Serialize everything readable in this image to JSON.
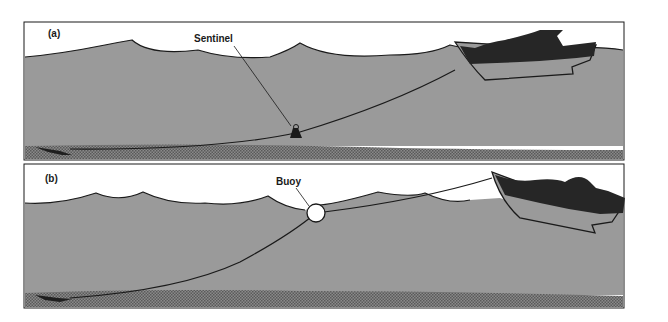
{
  "figure": {
    "panels": [
      {
        "id": "a",
        "panel_label": "(a)",
        "callout_label": "Sentinel",
        "description": "Boat anchored with a sentinel (weight) sliding down the anchor rode to the seabed"
      },
      {
        "id": "b",
        "panel_label": "(b)",
        "callout_label": "Buoy",
        "description": "Boat anchored with a buoy on the surface supporting the anchor rode"
      }
    ],
    "colors": {
      "sky": "#ffffff",
      "water": "#9a9a9a",
      "seabed": "#7d7d7d",
      "outline": "#1a1a1a",
      "boat": "#262626"
    }
  }
}
